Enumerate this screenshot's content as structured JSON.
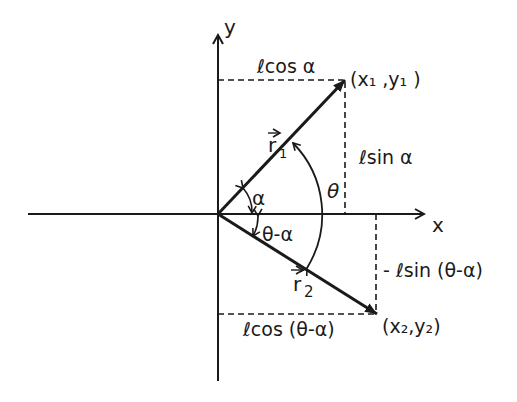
{
  "diagram": {
    "colors": {
      "ink": "#1a1a1a",
      "background": "#ffffff"
    },
    "axes": {
      "x_label": "x",
      "y_label": "y"
    },
    "vectors": [
      {
        "name": "r1",
        "label_base": "r",
        "label_sub": "1",
        "tip_label": "(x₁ ,y₁ )"
      },
      {
        "name": "r2",
        "label_base": "r",
        "label_sub": "2",
        "tip_label": "(x₂,y₂)"
      }
    ],
    "angles": {
      "alpha": "α",
      "theta": "θ",
      "theta_minus_alpha": "θ-α"
    },
    "projections": {
      "r1_horizontal": "ℓcos α",
      "r1_vertical": "ℓsin α",
      "r2_horizontal": "ℓcos (θ-α)",
      "r2_vertical": "- ℓsin (θ-α)"
    }
  }
}
